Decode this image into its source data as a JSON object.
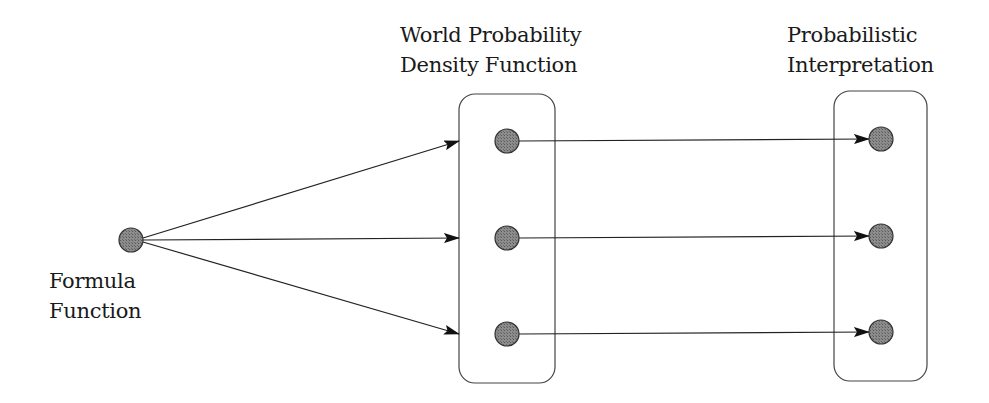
{
  "labels": {
    "formula_function": {
      "line1": "Formula",
      "line2": "Function"
    },
    "world_pdf": {
      "line1": "World Probability",
      "line2": "Density Function"
    },
    "probabilistic_interpretation": {
      "line1": "Probabilistic",
      "line2": "Interpretation"
    }
  },
  "colors": {
    "node_fill": "#8a8a8a",
    "node_stroke": "#333333",
    "edge": "#222222",
    "box_stroke": "#444444",
    "text": "#1a1a1a"
  },
  "nodes": {
    "formula": {
      "cx": 131,
      "cy": 240,
      "r": 12
    },
    "world_pdf": [
      {
        "cx": 507,
        "cy": 141,
        "r": 12
      },
      {
        "cx": 507,
        "cy": 238,
        "r": 12
      },
      {
        "cx": 507,
        "cy": 334,
        "r": 12
      }
    ],
    "interpretation": [
      {
        "cx": 881,
        "cy": 139,
        "r": 12
      },
      {
        "cx": 881,
        "cy": 236,
        "r": 12
      },
      {
        "cx": 881,
        "cy": 332,
        "r": 12
      }
    ]
  },
  "boxes": {
    "world_pdf": {
      "x": 459,
      "y": 94,
      "w": 96,
      "h": 289,
      "rx": 16
    },
    "interpretation": {
      "x": 834,
      "y": 91,
      "w": 93,
      "h": 290,
      "rx": 16
    }
  }
}
